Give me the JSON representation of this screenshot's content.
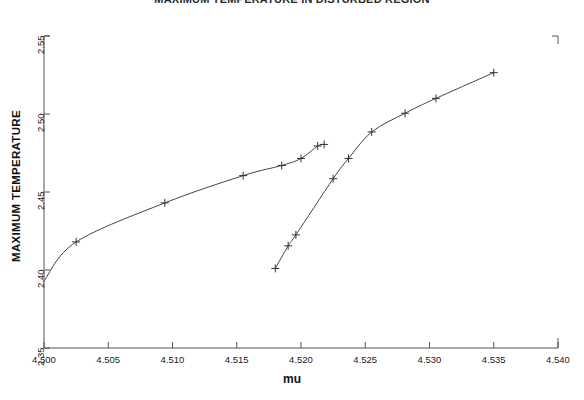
{
  "chart_data": {
    "type": "line",
    "title": "MAXIMUM TEMPERATURE IN DISTURBED REGION",
    "xlabel": "mu",
    "ylabel": "MAXIMUM TEMPERATURE",
    "xlim": [
      4.5,
      4.54
    ],
    "ylim": [
      2.35,
      2.55
    ],
    "xticks": [
      "4.500",
      "4.505",
      "4.510",
      "4.515",
      "4.520",
      "4.525",
      "4.530",
      "4.535",
      "4.540"
    ],
    "xtick_values": [
      4.5,
      4.505,
      4.51,
      4.515,
      4.52,
      4.525,
      4.53,
      4.535,
      4.54
    ],
    "yticks": [
      "2.35",
      "2.40",
      "2.45",
      "2.50",
      "2.55"
    ],
    "ytick_values": [
      2.35,
      2.4,
      2.45,
      2.5,
      2.55
    ],
    "grid": false,
    "legend": null,
    "marker": "plus",
    "line_color": "#444444",
    "series": [
      {
        "name": "upper-branch",
        "x": [
          4.5,
          4.5025,
          4.5094,
          4.5155,
          4.5185,
          4.52,
          4.5213,
          4.5218
        ],
        "y": [
          2.393,
          2.418,
          2.443,
          2.4605,
          2.467,
          2.4715,
          2.4795,
          2.4805
        ],
        "markers": [
          false,
          true,
          true,
          true,
          true,
          true,
          true,
          true
        ]
      },
      {
        "name": "lower-branch",
        "x": [
          4.518,
          4.519,
          4.5196,
          4.5225,
          4.5237,
          4.5255,
          4.5281,
          4.5305,
          4.535
        ],
        "y": [
          2.401,
          2.4155,
          2.4225,
          2.4585,
          2.4715,
          2.4885,
          2.5005,
          2.51,
          2.5265
        ],
        "markers": [
          true,
          true,
          true,
          true,
          true,
          true,
          true,
          true,
          true
        ]
      }
    ]
  },
  "axes": {
    "x_axis_name": "mu-axis",
    "y_axis_name": "maximum-temperature-axis"
  }
}
